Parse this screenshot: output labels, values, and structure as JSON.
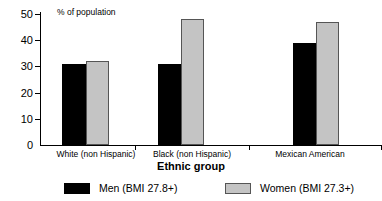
{
  "chart_data": {
    "type": "bar",
    "title": "",
    "ylabel": "% of population",
    "xlabel": "Ethnic group",
    "categories": [
      "White (non Hispanic)",
      "Black (non Hispanic)",
      "Mexican American"
    ],
    "series": [
      {
        "name": "Men (BMI 27.8+)",
        "color": "#000000",
        "values": [
          31,
          31,
          39
        ]
      },
      {
        "name": "Women (BMI 27.3+)",
        "color": "#c4c4c4",
        "values": [
          32,
          48,
          47
        ]
      }
    ],
    "ylim": [
      0,
      50
    ],
    "yticks": [
      0,
      10,
      20,
      30,
      40,
      50
    ],
    "ytick_labels": [
      "0",
      "10",
      "20",
      "30",
      "40",
      "50"
    ],
    "grid": false,
    "legend_position": "bottom"
  },
  "axis": {
    "y_title": "% of population",
    "x_title": "Ethnic group",
    "y_tick_0": "0",
    "y_tick_1": "10",
    "y_tick_2": "20",
    "y_tick_3": "30",
    "y_tick_4": "40",
    "y_tick_5": "50"
  },
  "categories": {
    "c0": "White (non Hispanic)",
    "c1": "Black (non Hispanic)",
    "c2": "Mexican American"
  },
  "legend": {
    "men": "Men (BMI 27.8+)",
    "women": "Women (BMI 27.3+)"
  }
}
